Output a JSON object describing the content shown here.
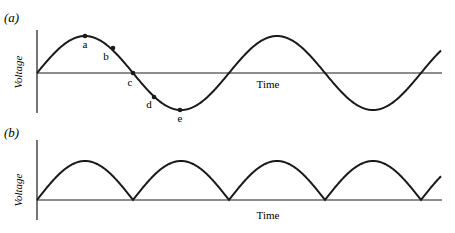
{
  "figure": {
    "panels": [
      {
        "id": "a",
        "label": "(a)",
        "ylabel": "Voltage",
        "xlabel": "Time",
        "waveform": "sine",
        "points": [
          {
            "name": "a",
            "label": "a"
          },
          {
            "name": "b",
            "label": "b"
          },
          {
            "name": "c",
            "label": "c"
          },
          {
            "name": "d",
            "label": "d"
          },
          {
            "name": "e",
            "label": "e"
          }
        ]
      },
      {
        "id": "b",
        "label": "(b)",
        "ylabel": "Voltage",
        "xlabel": "Time",
        "waveform": "full-wave rectified sine"
      }
    ],
    "colors": {
      "line": "#1a1a1a",
      "background": "#ffffff"
    }
  },
  "chart_data": [
    {
      "type": "line",
      "title": "(a)",
      "xlabel": "Time",
      "ylabel": "Voltage",
      "series": [
        {
          "name": "AC voltage",
          "function": "sin(t)",
          "t_range_cycles": [
            0,
            2.12
          ]
        }
      ],
      "annotations": [
        {
          "label": "a",
          "phase_deg": 90
        },
        {
          "label": "b",
          "phase_deg": 143
        },
        {
          "label": "c",
          "phase_deg": 180
        },
        {
          "label": "d",
          "phase_deg": 225
        },
        {
          "label": "e",
          "phase_deg": 270
        }
      ],
      "grid": false
    },
    {
      "type": "line",
      "title": "(b)",
      "xlabel": "Time",
      "ylabel": "Voltage",
      "series": [
        {
          "name": "Rectified voltage",
          "function": "|sin(t)|",
          "t_range_cycles": [
            0,
            2.12
          ]
        }
      ],
      "grid": false
    }
  ]
}
